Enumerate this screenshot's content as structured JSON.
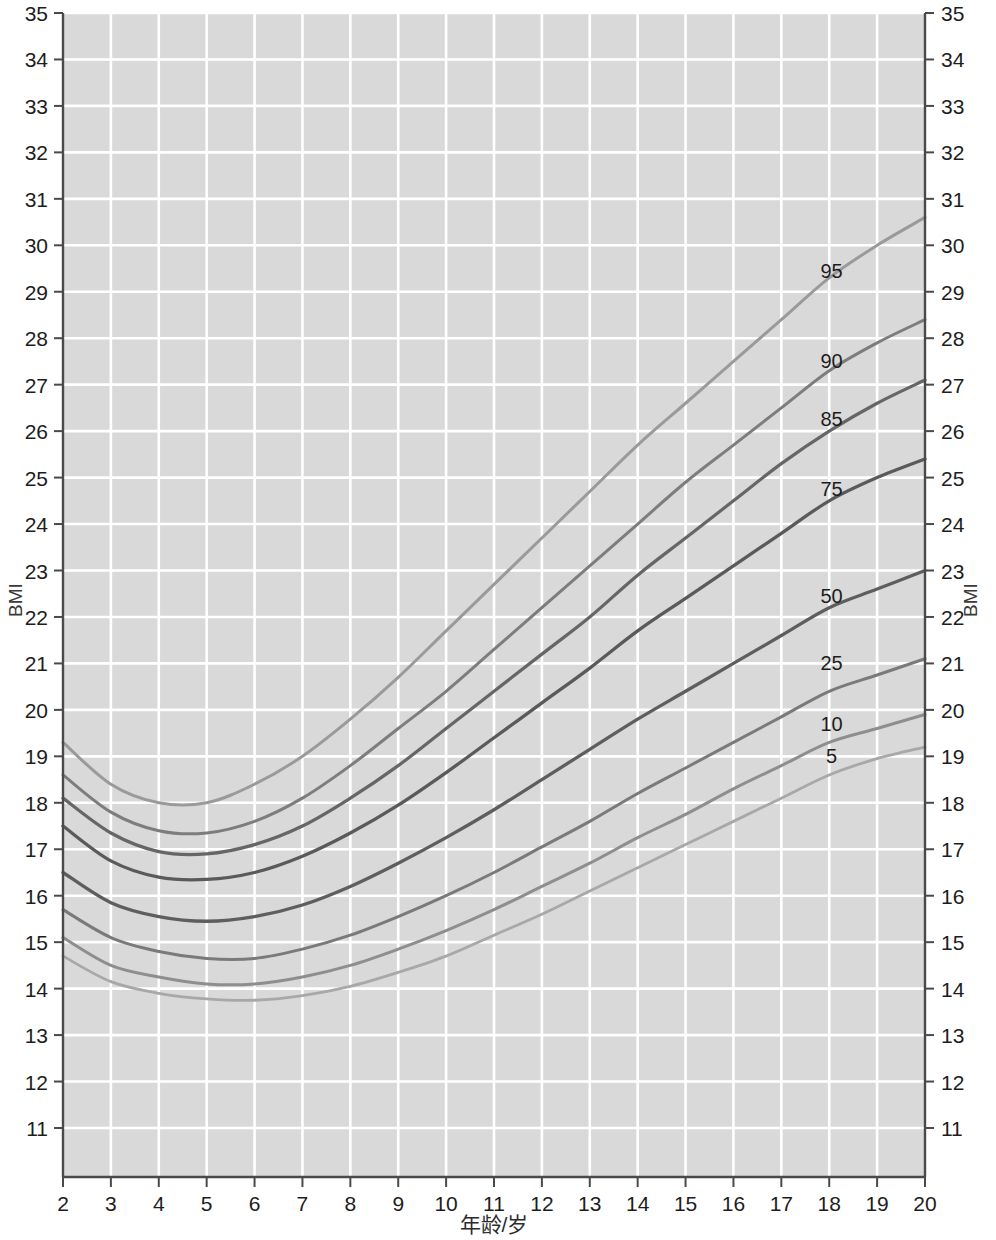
{
  "chart_data": {
    "type": "line",
    "title": "",
    "xlabel": "年龄/岁",
    "ylabel": "BMI",
    "ylabel_right": "BMI",
    "xlim": [
      2,
      20
    ],
    "ylim": [
      10.5,
      35
    ],
    "grid": true,
    "legend_position": "inline-right-labels",
    "xticks": [
      2,
      3,
      4,
      5,
      6,
      7,
      8,
      9,
      10,
      11,
      12,
      13,
      14,
      15,
      16,
      17,
      18,
      19,
      20
    ],
    "yticks": [
      11,
      12,
      13,
      14,
      15,
      16,
      17,
      18,
      19,
      20,
      21,
      22,
      23,
      24,
      25,
      26,
      27,
      28,
      29,
      30,
      31,
      32,
      33,
      34,
      35
    ],
    "x": [
      2,
      3,
      4,
      5,
      6,
      7,
      8,
      9,
      10,
      11,
      12,
      13,
      14,
      15,
      16,
      17,
      18,
      19,
      20
    ],
    "series": [
      {
        "name": "95",
        "label": "95",
        "color": "#9a9a9a",
        "width": 3.0,
        "label_x": 18.05,
        "label_y": 29.3,
        "values": [
          19.3,
          18.4,
          18.0,
          18.0,
          18.4,
          19.0,
          19.8,
          20.7,
          21.7,
          22.7,
          23.7,
          24.7,
          25.7,
          26.6,
          27.5,
          28.4,
          29.3,
          30.0,
          30.6
        ]
      },
      {
        "name": "90",
        "label": "90",
        "color": "#7d7d7d",
        "width": 3.0,
        "label_x": 18.05,
        "label_y": 27.35,
        "values": [
          18.6,
          17.8,
          17.4,
          17.35,
          17.6,
          18.1,
          18.8,
          19.6,
          20.4,
          21.3,
          22.2,
          23.1,
          24.0,
          24.9,
          25.7,
          26.5,
          27.3,
          27.9,
          28.4
        ]
      },
      {
        "name": "85",
        "label": "85",
        "color": "#666666",
        "width": 3.2,
        "label_x": 18.05,
        "label_y": 26.1,
        "values": [
          18.1,
          17.35,
          16.95,
          16.9,
          17.1,
          17.5,
          18.1,
          18.8,
          19.6,
          20.4,
          21.2,
          22.0,
          22.9,
          23.7,
          24.5,
          25.3,
          26.0,
          26.6,
          27.1
        ]
      },
      {
        "name": "75",
        "label": "75",
        "color": "#5a5a5a",
        "width": 3.3,
        "label_x": 18.05,
        "label_y": 24.6,
        "values": [
          17.5,
          16.75,
          16.4,
          16.35,
          16.5,
          16.85,
          17.35,
          17.95,
          18.65,
          19.4,
          20.15,
          20.9,
          21.7,
          22.4,
          23.1,
          23.8,
          24.5,
          25.0,
          25.4
        ]
      },
      {
        "name": "50",
        "label": "50",
        "color": "#5e5e5e",
        "width": 3.3,
        "label_x": 18.05,
        "label_y": 22.3,
        "values": [
          16.5,
          15.85,
          15.55,
          15.45,
          15.55,
          15.8,
          16.2,
          16.7,
          17.25,
          17.85,
          18.5,
          19.15,
          19.8,
          20.4,
          21.0,
          21.6,
          22.2,
          22.6,
          23.0
        ]
      },
      {
        "name": "25",
        "label": "25",
        "color": "#7a7a7a",
        "width": 3.0,
        "label_x": 18.05,
        "label_y": 20.85,
        "values": [
          15.7,
          15.1,
          14.8,
          14.65,
          14.65,
          14.85,
          15.15,
          15.55,
          16.0,
          16.5,
          17.05,
          17.6,
          18.2,
          18.75,
          19.3,
          19.85,
          20.4,
          20.75,
          21.1
        ]
      },
      {
        "name": "10",
        "label": "10",
        "color": "#8e8e8e",
        "width": 3.0,
        "label_x": 18.05,
        "label_y": 19.55,
        "values": [
          15.1,
          14.5,
          14.25,
          14.1,
          14.1,
          14.25,
          14.5,
          14.85,
          15.25,
          15.7,
          16.2,
          16.7,
          17.25,
          17.75,
          18.3,
          18.8,
          19.3,
          19.6,
          19.9
        ]
      },
      {
        "name": "5",
        "label": "5",
        "color": "#a8a8a8",
        "width": 2.8,
        "label_x": 18.05,
        "label_y": 18.85,
        "values": [
          14.7,
          14.15,
          13.9,
          13.78,
          13.75,
          13.85,
          14.05,
          14.35,
          14.7,
          15.15,
          15.6,
          16.1,
          16.6,
          17.1,
          17.6,
          18.1,
          18.6,
          18.95,
          19.2
        ]
      }
    ]
  },
  "style": {
    "plot_background": "#d9d9d9",
    "gridline_color": "#ffffff",
    "axis_color": "#4a4a4a",
    "page_background": "#ffffff",
    "tick_text_color": "#1d1d1d"
  },
  "watermark": {
    "line1": "",
    "line2": "",
    "visible": false
  }
}
